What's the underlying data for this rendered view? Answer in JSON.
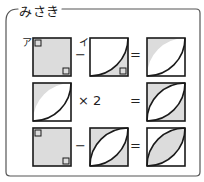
{
  "panel": {
    "speaker_name": "みさき",
    "border_color": "#555555",
    "background_color": "#ffffff"
  },
  "style": {
    "shade_color": "#dcdcdc",
    "stroke_color": "#1a1a1a",
    "white": "#ffffff",
    "square_size": 38
  },
  "figure_labels": [
    {
      "text": "ア",
      "x": 22,
      "y": 34
    },
    {
      "text": "イ",
      "x": 79,
      "y": 34
    }
  ],
  "rows": [
    {
      "id": "row-1",
      "operator_1": "−",
      "operator_2": "=",
      "op1_x": 75,
      "op1_y": 47,
      "op2_x": 130,
      "op2_y": 47,
      "figures": [
        {
          "name": "full-shaded-square-with-right-angle-marks",
          "x": 33,
          "y": 38,
          "kind": "full",
          "shaded": true,
          "marks": [
            "tl",
            "br"
          ]
        },
        {
          "name": "quarter-circle-lower-region-shaded",
          "x": 90,
          "y": 38,
          "kind": "arc-lower",
          "shaded": true,
          "marks": [
            "br"
          ]
        },
        {
          "name": "quarter-circle-upper-sliver-shaded",
          "x": 147,
          "y": 38,
          "kind": "arc-upper",
          "shaded": true,
          "marks": []
        }
      ]
    },
    {
      "id": "row-2",
      "operator_1": "×  2",
      "operator_2": "=",
      "op1_x": 78,
      "op1_y": 93,
      "op2_x": 130,
      "op2_y": 93,
      "figures": [
        {
          "name": "quarter-circle-upper-sliver-shaded",
          "x": 33,
          "y": 83,
          "kind": "arc-upper",
          "shaded": true,
          "marks": []
        },
        {
          "name": "lens-outer-regions-shaded",
          "x": 147,
          "y": 83,
          "kind": "lens-outer",
          "shaded": true,
          "marks": []
        }
      ]
    },
    {
      "id": "row-3",
      "operator_1": "−",
      "operator_2": "=",
      "op1_x": 75,
      "op1_y": 138,
      "op2_x": 130,
      "op2_y": 138,
      "figures": [
        {
          "name": "full-shaded-square-with-right-angle-marks",
          "x": 33,
          "y": 128,
          "kind": "full",
          "shaded": true,
          "marks": [
            "tl",
            "br"
          ]
        },
        {
          "name": "lens-outer-regions-shaded",
          "x": 90,
          "y": 128,
          "kind": "lens-outer",
          "shaded": true,
          "marks": []
        },
        {
          "name": "lens-inner-shaded",
          "x": 147,
          "y": 128,
          "kind": "lens-inner",
          "shaded": true,
          "marks": []
        }
      ]
    }
  ]
}
